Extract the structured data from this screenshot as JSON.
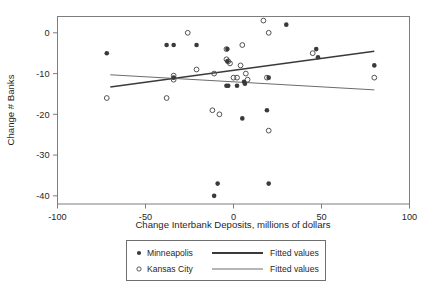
{
  "chart_data": {
    "type": "scatter",
    "title": "",
    "xlabel": "Change Interbank Deposits, millions of dollars",
    "ylabel": "Change # Banks",
    "xlim": [
      -100,
      100
    ],
    "ylim": [
      -42,
      4
    ],
    "xticks": [
      -100,
      -50,
      0,
      50,
      100
    ],
    "yticks": [
      0,
      -10,
      -20,
      -30,
      -40
    ],
    "xticklabels": [
      "-100",
      "-50",
      "0",
      "50",
      "100"
    ],
    "yticklabels": [
      "0",
      "-10",
      "-20",
      "-30",
      "-40"
    ],
    "grid": false,
    "legend_position": "below-axes",
    "series": [
      {
        "name": "Minneapolis",
        "marker": "filled-circle",
        "color": "#3a3a3a",
        "points": [
          [
            -72,
            -5
          ],
          [
            -38,
            -3
          ],
          [
            -34,
            -3
          ],
          [
            -34,
            -11
          ],
          [
            -21,
            -3
          ],
          [
            -11,
            -40
          ],
          [
            -9,
            -37
          ],
          [
            -4,
            -13
          ],
          [
            -3.5,
            -4
          ],
          [
            -3.5,
            -7
          ],
          [
            -3,
            -13
          ],
          [
            2,
            -13
          ],
          [
            5,
            -21
          ],
          [
            6,
            -12
          ],
          [
            6.5,
            -12.5
          ],
          [
            19,
            -19
          ],
          [
            20,
            -37
          ],
          [
            20,
            -11
          ],
          [
            30,
            2
          ],
          [
            47,
            -4
          ],
          [
            48,
            -6
          ],
          [
            80,
            -8
          ]
        ]
      },
      {
        "name": "Kansas City",
        "marker": "open-circle",
        "color": "#4a4a4a",
        "points": [
          [
            -72,
            -16
          ],
          [
            -38,
            -16
          ],
          [
            -34,
            -10.5
          ],
          [
            -34,
            -11.5
          ],
          [
            -26,
            0
          ],
          [
            -21,
            -9
          ],
          [
            -12,
            -19
          ],
          [
            -11,
            -10
          ],
          [
            -8,
            -20
          ],
          [
            -4,
            -4
          ],
          [
            -4,
            -6.5
          ],
          [
            -3,
            -7
          ],
          [
            -2,
            -7.5
          ],
          [
            0,
            -11
          ],
          [
            2,
            -11
          ],
          [
            4,
            -8
          ],
          [
            5,
            -3
          ],
          [
            7,
            -10
          ],
          [
            8,
            -11.5
          ],
          [
            17,
            3
          ],
          [
            19,
            -11
          ],
          [
            20,
            -24
          ],
          [
            20,
            0
          ],
          [
            45,
            -5
          ],
          [
            80,
            -11
          ]
        ]
      }
    ],
    "fits": [
      {
        "name": "Fitted values",
        "for_series": "Minneapolis",
        "style": "thick",
        "color": "#3a3a3a",
        "x0": -70,
        "y0": -13.3,
        "x1": 80,
        "y1": -4.5
      },
      {
        "name": "Fitted values",
        "for_series": "Kansas City",
        "style": "thin",
        "color": "#5a5a5a",
        "x0": -70,
        "y0": -10.3,
        "x1": 80,
        "y1": -14.0
      }
    ]
  },
  "legend": {
    "entries": [
      {
        "marker": "filled-circle",
        "label": "Minneapolis",
        "fit_label": "Fitted values"
      },
      {
        "marker": "open-circle",
        "label": "Kansas City",
        "fit_label": "Fitted values"
      }
    ]
  },
  "caption": {
    "text": ""
  }
}
